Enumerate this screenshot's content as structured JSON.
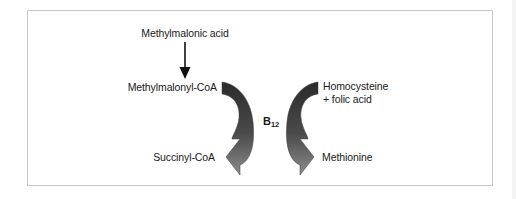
{
  "diagram": {
    "cofactor": {
      "label": "B",
      "subscript": "12"
    },
    "left_pathway": {
      "precursor": "Methylmalonic acid",
      "substrate": "Methylmalonyl-CoA",
      "product": "Succinyl-CoA",
      "arrow_direction": "clockwise",
      "precursor_arrow": "down-arrow"
    },
    "right_pathway": {
      "substrate_line1": "Homocysteine",
      "substrate_line2": "+ folic acid",
      "product": "Methionine",
      "arrow_direction": "counter-clockwise"
    },
    "colors": {
      "frame_border": "#c8c8c8",
      "arrow_dark": "#2e2e2e",
      "arrow_light": "#8a8a8a",
      "text": "#1a1a1a",
      "background": "#ffffff"
    }
  }
}
